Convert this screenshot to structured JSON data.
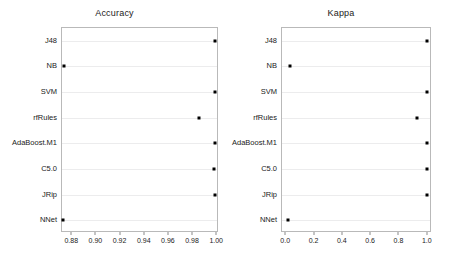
{
  "figure": {
    "background_color": "#ffffff",
    "frame_color": "#b9b9b9",
    "gridline_color": "#ececed",
    "marker_color": "#000000"
  },
  "chart_data": [
    {
      "type": "scatter",
      "title": "Accuracy",
      "xlabel": "",
      "ylabel": "",
      "categories": [
        "J48",
        "NB",
        "SVM",
        "rfRules",
        "AdaBoost.M1",
        "C5.0",
        "JRip",
        "NNet"
      ],
      "values": [
        0.998,
        0.873,
        0.998,
        0.985,
        0.998,
        0.997,
        0.998,
        0.872
      ],
      "xlim": [
        0.8715,
        1.0015
      ],
      "xticks": [
        0.88,
        0.9,
        0.92,
        0.94,
        0.96,
        0.98,
        1.0
      ],
      "xticklabels": [
        "0.88",
        "0.90",
        "0.92",
        "0.94",
        "0.96",
        "0.98",
        "1.00"
      ],
      "grid": true,
      "legend": "none",
      "marker": "filled-square"
    },
    {
      "type": "scatter",
      "title": "Kappa",
      "xlabel": "",
      "ylabel": "",
      "categories": [
        "J48",
        "NB",
        "SVM",
        "rfRules",
        "AdaBoost.M1",
        "C5.0",
        "JRip",
        "NNet"
      ],
      "values": [
        0.997,
        0.025,
        0.996,
        0.925,
        0.997,
        0.996,
        0.997,
        0.012
      ],
      "xlim": [
        -0.03,
        1.03
      ],
      "xticks": [
        0.0,
        0.2,
        0.4,
        0.6,
        0.8,
        1.0
      ],
      "xticklabels": [
        "0.0",
        "0.2",
        "0.4",
        "0.6",
        "0.8",
        "1.0"
      ],
      "grid": true,
      "legend": "none",
      "marker": "filled-square"
    }
  ]
}
